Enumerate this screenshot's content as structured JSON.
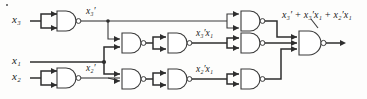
{
  "figure": {
    "kind": "logic-circuit-diagram"
  },
  "inputs": [
    {
      "id": "x3",
      "label": "x₃",
      "row": "top"
    },
    {
      "id": "x1",
      "label": "x₁",
      "row": "middle"
    },
    {
      "id": "x2",
      "label": "x₂",
      "row": "bottom"
    }
  ],
  "node_labels": [
    {
      "id": "x3-not",
      "label": "x₃′"
    },
    {
      "id": "x2-not",
      "label": "x₂′"
    },
    {
      "id": "x3-not-x1",
      "label": "x₃′x₁"
    },
    {
      "id": "x2-not-x1",
      "label": "x₂′x₁"
    }
  ],
  "output": {
    "id": "f",
    "label": "x₃′ + x₃′x₁ + x₂′x₁"
  },
  "gates": [
    {
      "id": "g1",
      "type": "nand",
      "inputs": 2,
      "role": "inverter-x3"
    },
    {
      "id": "g2",
      "type": "nand",
      "inputs": 2,
      "role": "inverter-x2"
    },
    {
      "id": "g3",
      "type": "nand",
      "inputs": 2,
      "role": "nand-x3not-x1"
    },
    {
      "id": "g4",
      "type": "nand",
      "inputs": 2,
      "role": "inverter-x3not-x1"
    },
    {
      "id": "g5",
      "type": "nand",
      "inputs": 2,
      "role": "nand-x2not-x1"
    },
    {
      "id": "g6",
      "type": "nand",
      "inputs": 2,
      "role": "inverter-x2not-x1"
    },
    {
      "id": "g7",
      "type": "nand",
      "inputs": 2,
      "role": "inverter-term-x3not"
    },
    {
      "id": "g8",
      "type": "nand",
      "inputs": 2,
      "role": "inverter-term-x3not-x1"
    },
    {
      "id": "g9",
      "type": "nand",
      "inputs": 2,
      "role": "inverter-term-x2not-x1"
    },
    {
      "id": "g10",
      "type": "nand",
      "inputs": 3,
      "role": "output-or-as-nand"
    }
  ],
  "colors": {
    "wire": "#3a3a3a",
    "gate_stroke": "#3a3a3a",
    "gate_fill": "#ffffff",
    "text": "#1a1a1a",
    "background": "#fdfdfc"
  }
}
